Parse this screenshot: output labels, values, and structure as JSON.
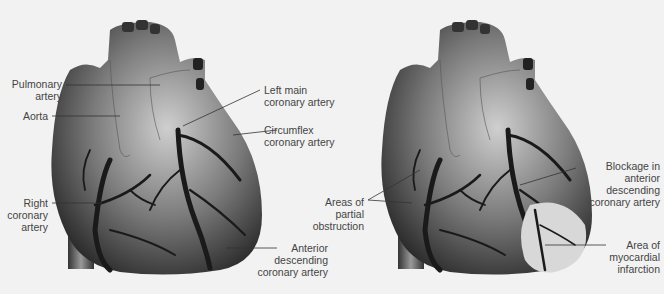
{
  "left_panel": {
    "labels": {
      "pulmonary_artery": "Pulmonary\nartery",
      "aorta": "Aorta",
      "right_coronary_artery": "Right\ncoronary\nartery",
      "left_main_coronary_artery": "Left main\ncoronary artery",
      "circumflex_coronary_artery": "Circumflex\ncoronary artery",
      "anterior_descending_coronary_artery": "Anterior\ndescending\ncoronary artery"
    }
  },
  "right_panel": {
    "labels": {
      "areas_of_partial_obstruction": "Areas of\npartial\nobstruction",
      "blockage_in_anterior_descending": "Blockage in\nanterior\ndescending\ncoronary artery",
      "area_of_myocardial_infarction": "Area of\nmyocardial\ninfarction"
    }
  },
  "colors": {
    "background": "#f2f2f2",
    "heart_light": "#c8c8c8",
    "heart_dark": "#2a2a2a",
    "artery": "#1a1a1a",
    "infarction": "#d8d8d8",
    "leader_line": "#333333"
  }
}
